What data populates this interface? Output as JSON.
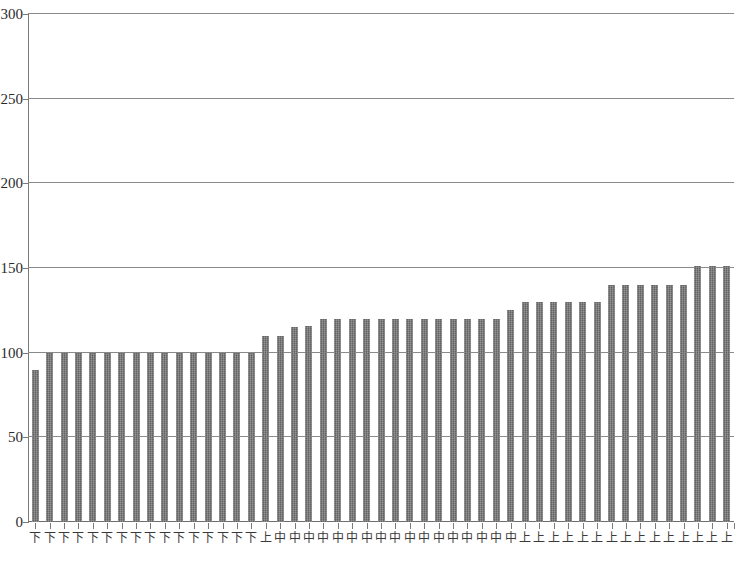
{
  "chart_data": {
    "type": "bar",
    "title": "",
    "subtitle": "",
    "xlabel": "",
    "ylabel": "",
    "ylim": [
      0,
      300
    ],
    "ytick_step": 50,
    "yticks": [
      0,
      50,
      100,
      150,
      200,
      250,
      300
    ],
    "ytick_labels": [
      "0",
      "50",
      "100",
      "150",
      "200",
      "250",
      "300"
    ],
    "grid": true,
    "grid_axis": "y",
    "legend": false,
    "legend_position": "none",
    "bar_color": "#6e6e6e",
    "gridline_color": "#8a8a8a",
    "axis_color": "#7a7a7a",
    "categories": [
      "下",
      "下",
      "下",
      "下",
      "下",
      "下",
      "下",
      "下",
      "下",
      "下",
      "下",
      "下",
      "下",
      "下",
      "下",
      "下",
      "上",
      "中",
      "中",
      "中",
      "中",
      "中",
      "中",
      "中",
      "中",
      "中",
      "中",
      "中",
      "中",
      "中",
      "中",
      "中",
      "中",
      "中",
      "上",
      "上",
      "上",
      "上",
      "上",
      "上",
      "上",
      "上",
      "上",
      "上",
      "上",
      "上",
      "上",
      "上",
      "上"
    ],
    "values": [
      90,
      100,
      100,
      100,
      100,
      100,
      100,
      100,
      100,
      100,
      100,
      100,
      100,
      100,
      100,
      100,
      110,
      110,
      115,
      116,
      120,
      120,
      120,
      120,
      120,
      120,
      120,
      120,
      120,
      120,
      120,
      120,
      120,
      125,
      130,
      130,
      130,
      130,
      130,
      130,
      140,
      140,
      140,
      140,
      140,
      140,
      151,
      151,
      151
    ],
    "series": [
      {
        "name": "",
        "values": [
          90,
          100,
          100,
          100,
          100,
          100,
          100,
          100,
          100,
          100,
          100,
          100,
          100,
          100,
          100,
          100,
          110,
          110,
          115,
          116,
          120,
          120,
          120,
          120,
          120,
          120,
          120,
          120,
          120,
          120,
          120,
          120,
          120,
          125,
          130,
          130,
          130,
          130,
          130,
          130,
          140,
          140,
          140,
          140,
          140,
          140,
          151,
          151,
          151
        ]
      }
    ],
    "n_bars": 49,
    "annotations": []
  },
  "caption": {
    "text": ""
  }
}
